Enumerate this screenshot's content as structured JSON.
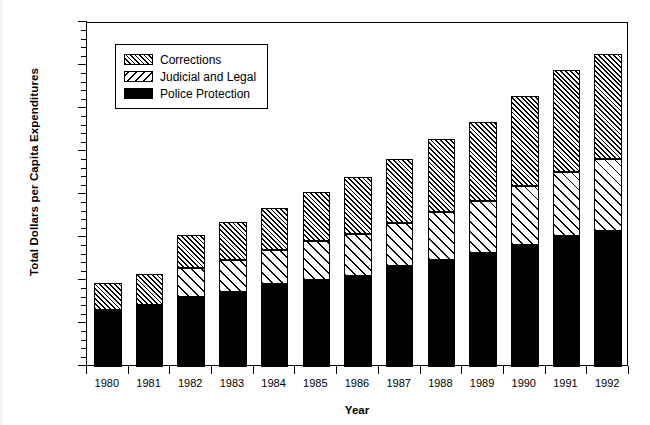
{
  "chart_data": {
    "type": "bar",
    "subtype": "stacked-vertical",
    "title": "",
    "xlabel": "Year",
    "ylabel": "Total Dollars per Capita Expenditures",
    "categories": [
      "1980",
      "1981",
      "1982",
      "1983",
      "1984",
      "1985",
      "1986",
      "1987",
      "1988",
      "1989",
      "1990",
      "1991",
      "1992"
    ],
    "series": [
      {
        "name": "Police Protection",
        "pattern": "solid-black",
        "color": "#000000",
        "values": [
          66,
          72,
          81,
          87,
          96,
          101,
          106,
          117,
          124,
          132,
          142,
          152,
          158
        ]
      },
      {
        "name": "Judicial and Legal",
        "pattern": "sparse-diagonal-hatch",
        "color": "#ffffff",
        "values": [
          0,
          0,
          34,
          37,
          40,
          45,
          49,
          51,
          56,
          61,
          68,
          75,
          84
        ]
      },
      {
        "name": "Corrections",
        "pattern": "dense-diagonal-hatch",
        "color": "#ffffff",
        "values": [
          32,
          36,
          39,
          45,
          49,
          57,
          66,
          74,
          85,
          92,
          105,
          118,
          122
        ]
      }
    ],
    "totals": [
      98,
      108,
      154,
      169,
      185,
      203,
      221,
      242,
      265,
      285,
      315,
      345,
      364
    ],
    "ylim": [
      0,
      400
    ],
    "y_ticks": [
      0,
      50,
      100,
      150,
      200,
      250,
      300,
      350,
      400
    ],
    "y_tick_labels": [
      "0",
      "50",
      "100",
      "150",
      "200",
      "250",
      "300",
      "350",
      "400"
    ],
    "y_minor_tick_interval": 10,
    "grid": false,
    "legend_position": "upper-left-inside",
    "legend_entries": [
      "Corrections",
      "Judicial and Legal",
      "Police Protection"
    ],
    "stack_order_bottom_to_top": [
      "Police Protection",
      "Judicial and Legal",
      "Corrections"
    ]
  },
  "axes": {
    "y_title": "Total Dollars per Capita Expenditures",
    "x_title": "Year"
  },
  "legend": {
    "items": [
      {
        "label": "Corrections",
        "swatch": "dense-hatch-swatch"
      },
      {
        "label": "Judicial and Legal",
        "swatch": "sparse-hatch-swatch"
      },
      {
        "label": "Police Protection",
        "swatch": "solid-black-swatch"
      }
    ]
  }
}
